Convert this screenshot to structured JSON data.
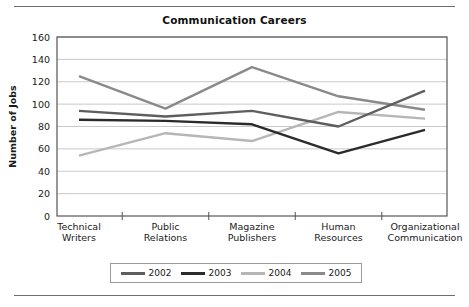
{
  "chart_data": {
    "type": "line",
    "title": "Communication Careers",
    "xlabel": "",
    "ylabel": "Number of Jobs",
    "ylim": [
      0,
      160
    ],
    "ytick_step": 20,
    "yticks": [
      "0",
      "20",
      "40",
      "60",
      "80",
      "100",
      "120",
      "140",
      "160"
    ],
    "grid": true,
    "legend_position": "bottom",
    "categories": [
      "Technical Writers",
      "Public Relations",
      "Magazine Publishers",
      "Human Resources",
      "Organizational Communication"
    ],
    "category_lines": [
      [
        "Technical",
        "Writers"
      ],
      [
        "Public",
        "Relations"
      ],
      [
        "Magazine",
        "Publishers"
      ],
      [
        "Human",
        "Resources"
      ],
      [
        "Organizational",
        "Communication"
      ]
    ],
    "series": [
      {
        "name": "2002",
        "color": "#5e5e5e",
        "values": [
          94,
          89,
          94,
          80,
          112
        ]
      },
      {
        "name": "2003",
        "color": "#2b2b2b",
        "values": [
          86,
          85,
          82,
          56,
          77
        ]
      },
      {
        "name": "2004",
        "color": "#b6b6b6",
        "values": [
          54,
          74,
          67,
          93,
          87
        ]
      },
      {
        "name": "2005",
        "color": "#8a8a8a",
        "values": [
          125,
          96,
          133,
          107,
          95
        ]
      }
    ]
  },
  "axis_colors": {
    "frame": "#555555",
    "gridline": "#c9c9c9",
    "tick": "#555555",
    "text": "#1a1a1a"
  }
}
